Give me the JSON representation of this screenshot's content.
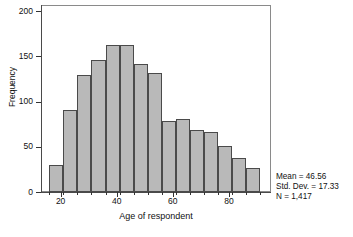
{
  "chart_data": {
    "type": "bar",
    "title": "",
    "subtitle": "",
    "xlabel": "Age of respondent",
    "ylabel": "Frequency",
    "grid": false,
    "legend": null,
    "xlim": [
      13,
      95
    ],
    "ylim": [
      0,
      200
    ],
    "bin_width": 5,
    "x_ticks": [
      20,
      40,
      60,
      80
    ],
    "x_tick_labels": [
      "20",
      "40",
      "60",
      "80"
    ],
    "y_ticks": [
      0,
      50,
      100,
      150,
      200
    ],
    "y_tick_labels": [
      "0",
      "50",
      "100",
      "150",
      "200"
    ],
    "bin_edges": [
      16,
      21,
      26,
      31,
      36,
      41,
      46,
      51,
      56,
      61,
      66,
      71,
      76,
      81,
      86,
      91
    ],
    "categories": [
      "16-21",
      "21-26",
      "26-31",
      "31-36",
      "36-41",
      "41-46",
      "46-51",
      "51-56",
      "56-61",
      "61-66",
      "66-71",
      "71-76",
      "76-81",
      "81-86",
      "86-91"
    ],
    "values": [
      30,
      91,
      129,
      146,
      163,
      163,
      141,
      132,
      78,
      81,
      69,
      66,
      51,
      38,
      26
    ],
    "series": [
      {
        "name": "Frequency",
        "values": [
          30,
          91,
          129,
          146,
          163,
          163,
          141,
          132,
          78,
          81,
          69,
          66,
          51,
          38,
          26
        ]
      }
    ],
    "annotations": [
      "Mean = 46.56",
      "Std. Dev. = 17.33",
      "N = 1,417"
    ],
    "statistics": {
      "mean_label": "Mean = 46.56",
      "std_dev_label": "Std. Dev. = 17.33",
      "n_label": "N = 1,417",
      "mean": 46.56,
      "std_dev": 17.33,
      "n": 1417
    },
    "colors": {
      "bar_fill": "#b9b9b9",
      "bar_stroke": "#4a4a4a",
      "axis": "#4a4a4a",
      "frame": "#8a8a8a",
      "text": "#111111",
      "background": "#ffffff"
    }
  }
}
